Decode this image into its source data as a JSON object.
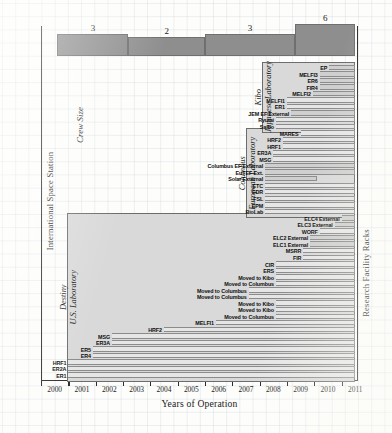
{
  "figure": {
    "axis_left_title": "International Space Station",
    "axis_right_title": "Research Facility Racks",
    "axis_x_title": "Years of Operation",
    "crew_label": "Crew Size"
  },
  "chart_data": {
    "type": "bar",
    "title": "",
    "xlabel": "Years of Operation",
    "ylabel": "Research Facility Racks",
    "y2label": "International Space Station",
    "xlim": [
      2000,
      2011.6
    ],
    "grid": true,
    "legend": "none",
    "x_ticks": [
      "2000",
      "2001",
      "2002",
      "2003",
      "2004",
      "2005",
      "2006",
      "2007",
      "2008",
      "2009",
      "2010",
      "2011"
    ],
    "crew_size_steps": [
      {
        "label": "3",
        "start": 2000.6,
        "end": 2003.2,
        "value": 3
      },
      {
        "label": "2",
        "start": 2003.2,
        "end": 2006.0,
        "value": 2
      },
      {
        "label": "3",
        "start": 2006.0,
        "end": 2009.3,
        "value": 3
      },
      {
        "label": "6",
        "start": 2009.3,
        "end": 2011.5,
        "value": 6
      }
    ],
    "modules": [
      {
        "name": "Destiny",
        "sub": "U.S. Laboratory",
        "start": 2000.95,
        "end": 2011.5
      },
      {
        "name": "Columbus",
        "sub": "European Laboratory",
        "start": 2007.5,
        "end": 2011.5
      },
      {
        "name": "Kibo",
        "sub": "Japanese Laboratory",
        "start": 2008.1,
        "end": 2011.5
      }
    ],
    "racks": [
      {
        "label": "EP",
        "start": 2010.55,
        "end": 2011.5,
        "external": true,
        "module": "Kibo"
      },
      {
        "label": "MELFI3",
        "start": 2010.2,
        "end": 2011.5,
        "external": true,
        "module": "Kibo"
      },
      {
        "label": "ER6",
        "start": 2010.2,
        "end": 2011.5,
        "external": true,
        "module": "Kibo"
      },
      {
        "label": "FIR4",
        "start": 2010.2,
        "end": 2011.5,
        "external": true,
        "module": "Kibo"
      },
      {
        "label": "MELFI2",
        "start": 2009.95,
        "end": 2011.5,
        "external": true,
        "module": "Kibo"
      },
      {
        "label": "MELFI1",
        "start": 2009.0,
        "end": 2011.5,
        "external": false,
        "module": "Kibo"
      },
      {
        "label": "ER1",
        "start": 2009.0,
        "end": 2011.5,
        "external": false,
        "module": "Kibo"
      },
      {
        "label": "JEM EF External",
        "start": 2009.15,
        "end": 2011.5,
        "external": true,
        "module": "Kibo"
      },
      {
        "label": "Ryutai",
        "start": 2008.6,
        "end": 2011.5,
        "external": false,
        "module": "Kibo"
      },
      {
        "label": "Saibo",
        "start": 2008.6,
        "end": 2011.5,
        "external": false,
        "module": "Kibo"
      },
      {
        "label": "MARES",
        "start": 2009.5,
        "end": 2011.5,
        "external": false,
        "module": "Columbus"
      },
      {
        "label": "HRF2",
        "start": 2008.85,
        "end": 2011.5,
        "external": false,
        "module": "Columbus"
      },
      {
        "label": "HRF1",
        "start": 2008.85,
        "end": 2011.5,
        "external": false,
        "module": "Columbus"
      },
      {
        "label": "ER3A",
        "start": 2008.5,
        "end": 2011.5,
        "external": false,
        "module": "Columbus"
      },
      {
        "label": "MSG",
        "start": 2008.5,
        "end": 2011.5,
        "external": false,
        "module": "Columbus"
      },
      {
        "label": "Columbus EF External",
        "start": 2008.2,
        "end": 2011.5,
        "external": true,
        "module": "Columbus"
      },
      {
        "label": "EuTEF Ext.",
        "start": 2008.2,
        "end": 2011.5,
        "external": true,
        "module": "Columbus"
      },
      {
        "label": "Solar External",
        "start": 2008.2,
        "end": 2010.1,
        "external": true,
        "module": "Columbus"
      },
      {
        "label": "ETC",
        "start": 2008.2,
        "end": 2011.5,
        "external": false,
        "module": "Columbus"
      },
      {
        "label": "EDR",
        "start": 2008.2,
        "end": 2011.5,
        "external": false,
        "module": "Columbus"
      },
      {
        "label": "FSL",
        "start": 2008.2,
        "end": 2011.5,
        "external": false,
        "module": "Columbus"
      },
      {
        "label": "EPM",
        "start": 2008.2,
        "end": 2011.5,
        "external": false,
        "module": "Columbus"
      },
      {
        "label": "BioLab",
        "start": 2008.2,
        "end": 2011.5,
        "external": false,
        "module": "Columbus"
      },
      {
        "label": "ELC4 External",
        "start": 2011.0,
        "end": 2011.5,
        "external": true,
        "module": "Destiny"
      },
      {
        "label": "ELC3 External",
        "start": 2010.75,
        "end": 2011.5,
        "external": true,
        "module": "Destiny"
      },
      {
        "label": "WORF",
        "start": 2010.2,
        "end": 2011.5,
        "external": false,
        "module": "Destiny"
      },
      {
        "label": "ELC2 External",
        "start": 2009.85,
        "end": 2011.5,
        "external": true,
        "module": "Destiny"
      },
      {
        "label": "ELC1 External",
        "start": 2009.85,
        "end": 2011.5,
        "external": true,
        "module": "Destiny"
      },
      {
        "label": "MSRR",
        "start": 2009.6,
        "end": 2011.5,
        "external": false,
        "module": "Destiny"
      },
      {
        "label": "FIR",
        "start": 2009.6,
        "end": 2011.5,
        "external": false,
        "module": "Destiny"
      },
      {
        "label": "CIR",
        "start": 2008.6,
        "end": 2011.5,
        "external": false,
        "module": "Destiny"
      },
      {
        "label": "ERS",
        "start": 2008.6,
        "end": 2011.5,
        "external": false,
        "module": "Destiny"
      },
      {
        "label": "Moved to Kibo",
        "start": 2008.6,
        "end": 2011.5,
        "external": false,
        "module": "Destiny"
      },
      {
        "label": "Moved to Columbus",
        "start": 2008.6,
        "end": 2011.5,
        "external": false,
        "module": "Destiny"
      },
      {
        "label": "Moved to Columbus",
        "start": 2007.6,
        "end": 2011.5,
        "external": false,
        "module": "Destiny"
      },
      {
        "label": "Moved to Columbus",
        "start": 2007.6,
        "end": 2011.5,
        "external": false,
        "module": "Destiny"
      },
      {
        "label": "Moved to Kibo",
        "start": 2008.6,
        "end": 2011.5,
        "external": false,
        "module": "Destiny"
      },
      {
        "label": "Moved to Kibo",
        "start": 2008.6,
        "end": 2011.5,
        "external": false,
        "module": "Destiny"
      },
      {
        "label": "Moved to Columbus",
        "start": 2008.6,
        "end": 2011.5,
        "external": false,
        "module": "Destiny"
      },
      {
        "label": "MELFI1",
        "start": 2006.4,
        "end": 2011.5,
        "external": false,
        "module": "Destiny"
      },
      {
        "label": "HRF2",
        "start": 2004.5,
        "end": 2011.5,
        "external": false,
        "module": "Destiny"
      },
      {
        "label": "MSG",
        "start": 2002.6,
        "end": 2011.5,
        "external": false,
        "module": "Destiny"
      },
      {
        "label": "ER3A",
        "start": 2002.6,
        "end": 2011.5,
        "external": false,
        "module": "Destiny"
      },
      {
        "label": "ER5",
        "start": 2001.9,
        "end": 2011.5,
        "external": false,
        "module": "Destiny"
      },
      {
        "label": "ER4",
        "start": 2001.9,
        "end": 2011.5,
        "external": false,
        "module": "Destiny"
      },
      {
        "label": "HRF1",
        "start": 2001.0,
        "end": 2011.5,
        "external": false,
        "module": "Destiny"
      },
      {
        "label": "ER2A",
        "start": 2001.0,
        "end": 2011.5,
        "external": false,
        "module": "Destiny"
      },
      {
        "label": "ER1",
        "start": 2001.0,
        "end": 2011.5,
        "external": false,
        "module": "Destiny"
      }
    ]
  }
}
